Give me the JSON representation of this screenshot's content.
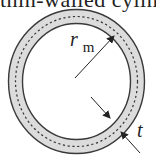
{
  "caption": {
    "text": "thin-walled cylinder"
  },
  "diagram": {
    "type": "thin-walled circular tube cross-section",
    "labels": {
      "mean_radius": "r",
      "mean_radius_subscript": "m",
      "thickness": "t"
    },
    "colors": {
      "ring_fill": "#dcdcdc",
      "ring_edge": "#3a3a3a",
      "midline": "#333333",
      "arrow": "#222222",
      "background": "#ffffff"
    }
  }
}
